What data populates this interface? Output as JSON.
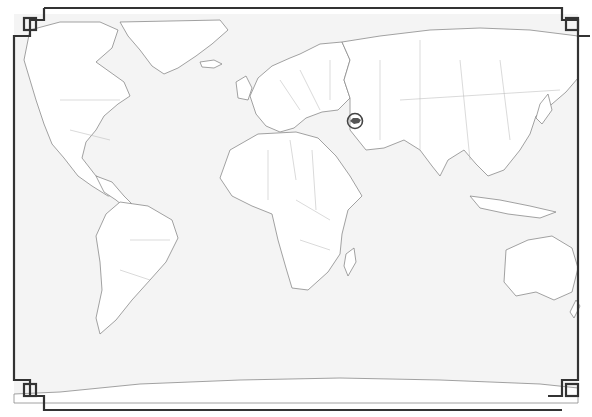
{
  "map": {
    "type": "world-political-outline",
    "highlight": {
      "country": "Azerbaijan",
      "marker": "circle-marker",
      "color": "#444444"
    },
    "colors": {
      "sea": "#f4f4f4",
      "land": "#ffffff",
      "coast": "#8a8a8a",
      "frame": "#333333"
    }
  }
}
